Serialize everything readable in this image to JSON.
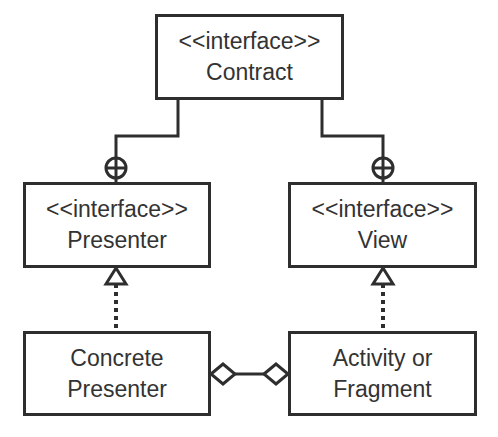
{
  "diagram": {
    "type": "UML class diagram",
    "nodes": {
      "contract": {
        "stereotype": "<<interface>>",
        "name": "Contract"
      },
      "presenter": {
        "stereotype": "<<interface>>",
        "name": "Presenter"
      },
      "view": {
        "stereotype": "<<interface>>",
        "name": "View"
      },
      "concrete_presenter": {
        "line1": "Concrete",
        "line2": "Presenter"
      },
      "activity": {
        "line1": "Activity or",
        "line2": "Fragment"
      }
    },
    "edges": [
      {
        "from": "contract",
        "to": "presenter",
        "kind": "nesting"
      },
      {
        "from": "contract",
        "to": "view",
        "kind": "nesting"
      },
      {
        "from": "concrete_presenter",
        "to": "presenter",
        "kind": "realization"
      },
      {
        "from": "activity",
        "to": "view",
        "kind": "realization"
      },
      {
        "from": "concrete_presenter",
        "to": "activity",
        "kind": "aggregation-both-ends"
      }
    ],
    "colors": {
      "line": "#2e2e2e",
      "background": "#ffffff"
    }
  }
}
